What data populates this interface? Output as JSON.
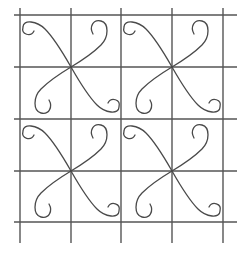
{
  "diagram": {
    "title": "",
    "type": "quilting-pattern-grid",
    "background": "#ffffff",
    "line_color": "#555555",
    "curl_color": "#4a4a4a",
    "grid": {
      "vertical_x": [
        20,
        71,
        121,
        172,
        223
      ],
      "horizontal_y": [
        15,
        67,
        119,
        171,
        222
      ],
      "line_start": 8,
      "vertical_end_y": 243,
      "horizontal_end_x": 237
    },
    "motifs": [
      {
        "name": "motif-top-left",
        "cx": 71,
        "cy": 67
      },
      {
        "name": "motif-top-right",
        "cx": 172,
        "cy": 67
      },
      {
        "name": "motif-bottom-left",
        "cx": 71,
        "cy": 171
      },
      {
        "name": "motif-bottom-right",
        "cx": 172,
        "cy": 171
      }
    ]
  }
}
